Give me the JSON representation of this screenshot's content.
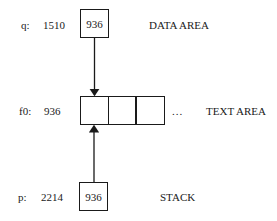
{
  "diagram": {
    "data_row": {
      "variable": "q:",
      "address": "1510",
      "cell_value": "936",
      "area_label": "DATA AREA"
    },
    "text_row": {
      "variable": "f0:",
      "address": "936",
      "cells": [
        "",
        "",
        ""
      ],
      "ellipsis": "...",
      "area_label": "TEXT AREA"
    },
    "stack_row": {
      "variable": "p:",
      "address": "2214",
      "cell_value": "936",
      "area_label": "STACK"
    },
    "arrows": [
      {
        "from": "data_row.cell",
        "to": "text_row.cells.0",
        "direction": "down"
      },
      {
        "from": "stack_row.cell",
        "to": "text_row.cells.0",
        "direction": "up"
      }
    ]
  }
}
